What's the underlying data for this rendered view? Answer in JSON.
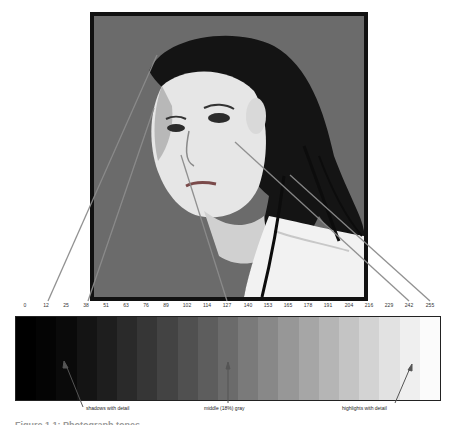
{
  "photo": {
    "alt": "black and white portrait of a woman with slicked-back wet hair",
    "background_color": "#6b6b6b",
    "border_color": "#111111"
  },
  "tick_labels": [
    "0",
    "12",
    "25",
    "38",
    "51",
    "63",
    "76",
    "89",
    "102",
    "114",
    "127",
    "140",
    "153",
    "165",
    "178",
    "191",
    "204",
    "216",
    "229",
    "242",
    "255"
  ],
  "steps": [
    {
      "value": 0,
      "color": "#000000"
    },
    {
      "value": 12,
      "color": "#040404"
    },
    {
      "value": 25,
      "color": "#0a0a0a"
    },
    {
      "value": 38,
      "color": "#141414"
    },
    {
      "value": 51,
      "color": "#1e1e1e"
    },
    {
      "value": 63,
      "color": "#2a2a2a"
    },
    {
      "value": 76,
      "color": "#363636"
    },
    {
      "value": 89,
      "color": "#434343"
    },
    {
      "value": 102,
      "color": "#505050"
    },
    {
      "value": 114,
      "color": "#5d5d5d"
    },
    {
      "value": 127,
      "color": "#6b6b6b"
    },
    {
      "value": 140,
      "color": "#7a7a7a"
    },
    {
      "value": 153,
      "color": "#888888"
    },
    {
      "value": 165,
      "color": "#979797"
    },
    {
      "value": 178,
      "color": "#a6a6a6"
    },
    {
      "value": 191,
      "color": "#b5b5b5"
    },
    {
      "value": 204,
      "color": "#c4c4c4"
    },
    {
      "value": 216,
      "color": "#d3d3d3"
    },
    {
      "value": 229,
      "color": "#e2e2e2"
    },
    {
      "value": 242,
      "color": "#efefef"
    },
    {
      "value": 255,
      "color": "#fbfbfb"
    }
  ],
  "annotations": {
    "shadows": "shadows with detail",
    "midtone": "middle (18%) gray",
    "highlights": "highlights with detail"
  },
  "caption": "Figure 1.1: Photograph tones"
}
